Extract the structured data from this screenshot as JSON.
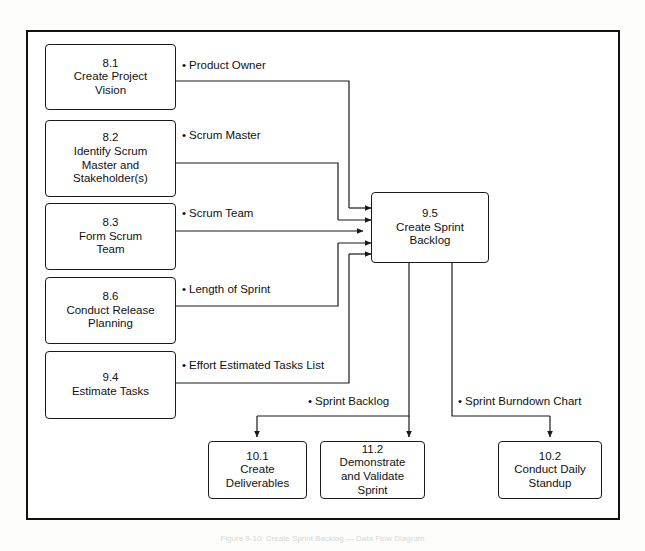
{
  "figure": {
    "caption": "Figure 9-10: Create Sprint Backlog — Data Flow Diagram",
    "frame_color": "#111111",
    "box_border_color": "#1a1a1a",
    "background_color": "#ffffff"
  },
  "processes": [
    {
      "id": "8.1",
      "number": "8.1",
      "title": "Create Project\nVision"
    },
    {
      "id": "8.2",
      "number": "8.2",
      "title": "Identify Scrum\nMaster and\nStakeholder(s)"
    },
    {
      "id": "8.3",
      "number": "8.3",
      "title": "Form Scrum\nTeam"
    },
    {
      "id": "8.6",
      "number": "8.6",
      "title": "Conduct Release\nPlanning"
    },
    {
      "id": "9.4",
      "number": "9.4",
      "title": "Estimate Tasks"
    },
    {
      "id": "9.5",
      "number": "9.5",
      "title": "Create Sprint\nBacklog"
    },
    {
      "id": "10.1",
      "number": "10.1",
      "title": "Create\nDeliverables"
    },
    {
      "id": "11.2",
      "number": "11.2",
      "title": "Demonstrate\nand Validate\nSprint"
    },
    {
      "id": "10.2",
      "number": "10.2",
      "title": "Conduct Daily\nStandup"
    }
  ],
  "flows": [
    {
      "id": "product-owner",
      "label": "Product Owner",
      "from": "8.1",
      "to": "9.5"
    },
    {
      "id": "scrum-master",
      "label": "Scrum Master",
      "from": "8.2",
      "to": "9.5"
    },
    {
      "id": "scrum-team",
      "label": "Scrum Team",
      "from": "8.3",
      "to": "9.5"
    },
    {
      "id": "length-of-sprint",
      "label": "Length of Sprint",
      "from": "8.6",
      "to": "9.5"
    },
    {
      "id": "effort-estimated",
      "label": "Effort Estimated Tasks List",
      "from": "9.4",
      "to": "9.5"
    },
    {
      "id": "sprint-backlog",
      "label": "Sprint Backlog",
      "from": "9.5",
      "to": "10.1, 11.2"
    },
    {
      "id": "sprint-burndown",
      "label": "Sprint Burndown Chart",
      "from": "9.5",
      "to": "10.2"
    }
  ],
  "bullet": "•"
}
